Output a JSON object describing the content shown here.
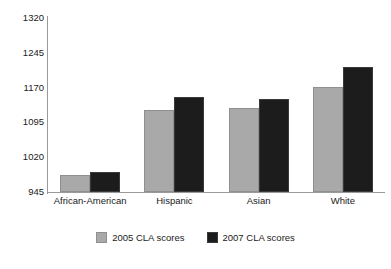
{
  "chart_data": {
    "type": "bar",
    "title": "",
    "xlabel": "",
    "ylabel": "",
    "categories": [
      "African-American",
      "Hispanic",
      "Asian",
      "White"
    ],
    "series": [
      {
        "name": "2005 CLA scores",
        "color": "#a9a9a9",
        "values": [
          982,
          1122,
          1126,
          1171
        ]
      },
      {
        "name": "2007 CLA scores",
        "color": "#1c1c1c",
        "values": [
          988,
          1150,
          1145,
          1215
        ]
      }
    ],
    "ylim": [
      945,
      1320
    ],
    "yticks": [
      945,
      1020,
      1095,
      1170,
      1245,
      1320
    ],
    "ytick_labels": [
      "945",
      "1020",
      "1095",
      "1170",
      "1245",
      "1320"
    ],
    "grid": false,
    "legend_position": "bottom"
  },
  "legend": {
    "entries": [
      {
        "label": "2005 CLA scores"
      },
      {
        "label": "2007 CLA scores"
      }
    ]
  }
}
